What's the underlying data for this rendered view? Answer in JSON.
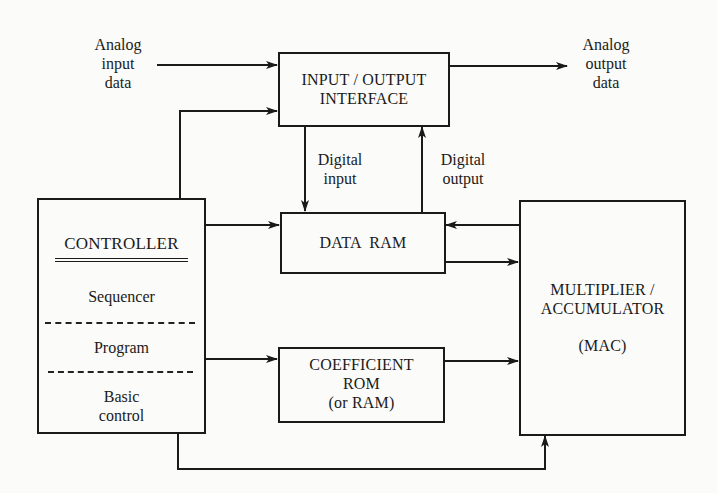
{
  "diagram": {
    "type": "block-diagram",
    "nodes": {
      "io_interface": {
        "line1": "INPUT / OUTPUT",
        "line2": "INTERFACE"
      },
      "controller": {
        "title": "CONTROLLER",
        "sections": [
          "Sequencer",
          "Program",
          "Basic",
          "control"
        ]
      },
      "data_ram": {
        "label": "DATA  RAM"
      },
      "coef_rom": {
        "line1": "COEFFICIENT",
        "line2": "ROM",
        "line3": "(or RAM)"
      },
      "mac": {
        "line1": "MULTIPLIER /",
        "line2": "ACCUMULATOR",
        "line3": "(MAC)"
      }
    },
    "labels": {
      "analog_input": [
        "Analog",
        "input",
        "data"
      ],
      "analog_output": [
        "Analog",
        "output",
        "data"
      ],
      "digital_input": [
        "Digital",
        "input"
      ],
      "digital_output": [
        "Digital",
        "output"
      ]
    },
    "edges": [
      {
        "from": "analog input data",
        "to": "INPUT / OUTPUT INTERFACE"
      },
      {
        "from": "INPUT / OUTPUT INTERFACE",
        "to": "analog output data"
      },
      {
        "from": "CONTROLLER",
        "to": "INPUT / OUTPUT INTERFACE"
      },
      {
        "from": "INPUT / OUTPUT INTERFACE",
        "to": "DATA RAM",
        "label": "Digital input"
      },
      {
        "from": "DATA RAM",
        "to": "INPUT / OUTPUT INTERFACE",
        "label": "Digital output"
      },
      {
        "from": "CONTROLLER",
        "to": "DATA RAM"
      },
      {
        "from": "MAC",
        "to": "DATA RAM"
      },
      {
        "from": "DATA RAM",
        "to": "MAC"
      },
      {
        "from": "CONTROLLER",
        "to": "COEFFICIENT ROM"
      },
      {
        "from": "COEFFICIENT ROM",
        "to": "MAC"
      },
      {
        "from": "CONTROLLER",
        "to": "MAC"
      }
    ]
  }
}
